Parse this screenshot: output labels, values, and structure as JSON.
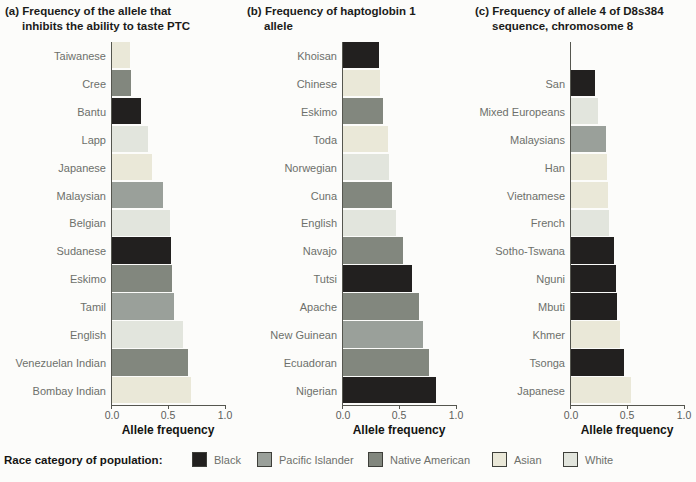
{
  "figure": {
    "background": "#fcfcfa",
    "axis_color": "#55564f"
  },
  "legend": {
    "title": "Race category of population:",
    "items": [
      {
        "key": "black",
        "label": "Black",
        "color": "#22201f"
      },
      {
        "key": "pacific_islander",
        "label": "Pacific Islander",
        "color": "#9aa09a"
      },
      {
        "key": "native_american",
        "label": "Native American",
        "color": "#82877e"
      },
      {
        "key": "asian",
        "label": "Asian",
        "color": "#eae8d8"
      },
      {
        "key": "white",
        "label": "White",
        "color": "#e2e5dd"
      }
    ]
  },
  "chart_data": [
    {
      "type": "bar",
      "orientation": "horizontal",
      "title": "(a) Frequency of the allele that inhibits the ability to taste PTC",
      "title_lines": [
        "(a) Frequency of the allele that",
        "inhibits the ability to taste PTC"
      ],
      "xlabel": "Allele frequency",
      "xlim": [
        0.0,
        1.0
      ],
      "xticks": [
        "0.0",
        "0.5",
        "1.0"
      ],
      "grid": false,
      "bars": [
        {
          "label": "Taiwanese",
          "value": 0.16,
          "category": "asian"
        },
        {
          "label": "Cree",
          "value": 0.17,
          "category": "native_american"
        },
        {
          "label": "Bantu",
          "value": 0.26,
          "category": "black"
        },
        {
          "label": "Lapp",
          "value": 0.32,
          "category": "white"
        },
        {
          "label": "Japanese",
          "value": 0.35,
          "category": "asian"
        },
        {
          "label": "Malaysian",
          "value": 0.45,
          "category": "pacific_islander"
        },
        {
          "label": "Belgian",
          "value": 0.51,
          "category": "white"
        },
        {
          "label": "Sudanese",
          "value": 0.52,
          "category": "black"
        },
        {
          "label": "Eskimo",
          "value": 0.53,
          "category": "native_american"
        },
        {
          "label": "Tamil",
          "value": 0.55,
          "category": "pacific_islander"
        },
        {
          "label": "English",
          "value": 0.63,
          "category": "white"
        },
        {
          "label": "Venezuelan Indian",
          "value": 0.67,
          "category": "native_american"
        },
        {
          "label": "Bombay Indian",
          "value": 0.7,
          "category": "asian"
        }
      ]
    },
    {
      "type": "bar",
      "orientation": "horizontal",
      "title": "(b) Frequency of haptoglobin 1 allele",
      "title_lines": [
        "(b) Frequency of haptoglobin 1",
        "allele"
      ],
      "xlabel": "Allele frequency",
      "xlim": [
        0.0,
        1.0
      ],
      "xticks": [
        "0.0",
        "0.5",
        "1.0"
      ],
      "grid": false,
      "bars": [
        {
          "label": "Khoisan",
          "value": 0.32,
          "category": "black"
        },
        {
          "label": "Chinese",
          "value": 0.33,
          "category": "asian"
        },
        {
          "label": "Eskimo",
          "value": 0.35,
          "category": "native_american"
        },
        {
          "label": "Toda",
          "value": 0.4,
          "category": "asian"
        },
        {
          "label": "Norwegian",
          "value": 0.41,
          "category": "white"
        },
        {
          "label": "Cuna",
          "value": 0.43,
          "category": "native_american"
        },
        {
          "label": "English",
          "value": 0.47,
          "category": "white"
        },
        {
          "label": "Navajo",
          "value": 0.53,
          "category": "native_american"
        },
        {
          "label": "Tutsi",
          "value": 0.61,
          "category": "black"
        },
        {
          "label": "Apache",
          "value": 0.67,
          "category": "native_american"
        },
        {
          "label": "New Guinean",
          "value": 0.71,
          "category": "pacific_islander"
        },
        {
          "label": "Ecuadoran",
          "value": 0.76,
          "category": "native_american"
        },
        {
          "label": "Nigerian",
          "value": 0.82,
          "category": "black"
        }
      ]
    },
    {
      "type": "bar",
      "orientation": "horizontal",
      "title": "(c) Frequency of allele 4 of D8s384 sequence, chromosome 8",
      "title_lines": [
        "(c) Frequency of allele 4 of D8s384",
        "sequence, chromosome 8"
      ],
      "xlabel": "Allele frequency",
      "xlim": [
        0.0,
        1.0
      ],
      "xticks": [
        "0.0",
        "0.5",
        "1.0"
      ],
      "grid": false,
      "bars": [
        {
          "label": "San",
          "value": 0.21,
          "category": "black"
        },
        {
          "label": "Mixed Europeans",
          "value": 0.24,
          "category": "white"
        },
        {
          "label": "Malaysians",
          "value": 0.31,
          "category": "pacific_islander"
        },
        {
          "label": "Han",
          "value": 0.32,
          "category": "asian"
        },
        {
          "label": "Vietnamese",
          "value": 0.33,
          "category": "asian"
        },
        {
          "label": "French",
          "value": 0.34,
          "category": "white"
        },
        {
          "label": "Sotho-Tswana",
          "value": 0.38,
          "category": "black"
        },
        {
          "label": "Nguni",
          "value": 0.4,
          "category": "black"
        },
        {
          "label": "Mbuti",
          "value": 0.41,
          "category": "black"
        },
        {
          "label": "Khmer",
          "value": 0.43,
          "category": "asian"
        },
        {
          "label": "Tsonga",
          "value": 0.47,
          "category": "black"
        },
        {
          "label": "Japanese",
          "value": 0.53,
          "category": "asian"
        }
      ]
    }
  ]
}
